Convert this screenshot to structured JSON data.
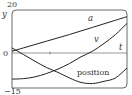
{
  "chart_data": {
    "type": "line",
    "title": "",
    "xlabel": "t",
    "ylabel": "y",
    "ylim": [
      -15,
      20
    ],
    "xlim": [
      0,
      10
    ],
    "y_tick_labels": [
      "20",
      "0",
      "-15"
    ],
    "grid": false,
    "legend": "inline labels",
    "x": [
      0,
      1,
      2,
      3,
      4,
      5,
      6,
      7,
      8,
      9,
      10
    ],
    "series": [
      {
        "name": "a",
        "values": [
          1.5,
          3.0,
          4.5,
          6.0,
          7.5,
          9.0,
          10.6,
          12.2,
          13.8,
          15.4,
          17.0
        ]
      },
      {
        "name": "v",
        "values": [
          -11.0,
          -10.8,
          -10.0,
          -8.5,
          -6.5,
          -4.0,
          -1.0,
          1.5,
          5.0,
          9.0,
          14.0
        ]
      },
      {
        "name": "position",
        "values": [
          3.0,
          0.0,
          -3.0,
          -5.8,
          -8.0,
          -10.5,
          -12.5,
          -13.0,
          -12.0,
          -10.5,
          -6.0
        ]
      }
    ]
  },
  "labels": {
    "y_axis": "y",
    "t_axis": "t",
    "y_max": "20",
    "y_zero": "0",
    "y_min": "−15",
    "curve_a": "a",
    "curve_v": "v",
    "curve_position": "position"
  }
}
